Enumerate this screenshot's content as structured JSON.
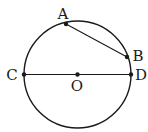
{
  "diagram": {
    "colors": {
      "stroke": "#1a1a1a",
      "background": "#ffffff"
    },
    "circle": {
      "center": "O",
      "cx": 77.5,
      "cy": 74.5,
      "r": 53.5
    },
    "points": [
      {
        "id": "A",
        "label": "A",
        "x": 66,
        "y": 24,
        "lx": 63,
        "ly": 14
      },
      {
        "id": "B",
        "label": "B",
        "x": 127,
        "y": 57,
        "lx": 137,
        "ly": 56
      },
      {
        "id": "C",
        "label": "C",
        "x": 24,
        "y": 74.5,
        "lx": 12,
        "ly": 75
      },
      {
        "id": "D",
        "label": "D",
        "x": 131,
        "y": 74.5,
        "lx": 141,
        "ly": 75
      },
      {
        "id": "O",
        "label": "O",
        "x": 77.5,
        "y": 74.5,
        "lx": 77,
        "ly": 86
      }
    ],
    "segments": [
      {
        "from": "A",
        "to": "B",
        "type": "chord"
      },
      {
        "from": "C",
        "to": "D",
        "type": "diameter"
      }
    ]
  }
}
